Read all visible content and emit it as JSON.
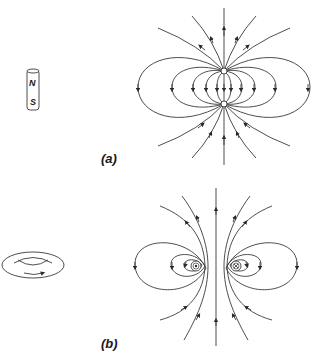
{
  "figure": {
    "panel_a": {
      "caption": "(a)",
      "object": "bar-magnet",
      "magnet_labels": {
        "north": "N",
        "south": "S"
      },
      "field": "dipole field lines emerging from north pole, returning to south pole"
    },
    "panel_b": {
      "caption": "(b)",
      "object": "current-loop-ring",
      "field": "field lines circulating around current loop cross-section",
      "current_symbols": {
        "left": "out-of-page (dot)",
        "right": "into-page (cross)"
      }
    },
    "colors": {
      "line": "#3a3a3a",
      "background": "#ffffff"
    }
  }
}
